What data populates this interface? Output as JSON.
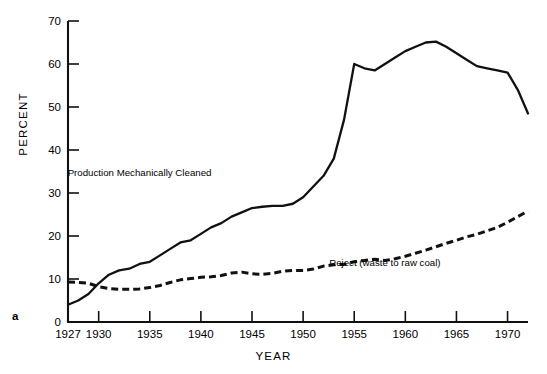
{
  "figure": {
    "panel_letter": "a",
    "background": "#ffffff",
    "line_color": "#111111"
  },
  "chart_data": {
    "type": "line",
    "title": "",
    "xlabel": "YEAR",
    "ylabel": "PERCENT",
    "xlim": [
      1927,
      1972
    ],
    "ylim": [
      0,
      70
    ],
    "xticks": [
      1927,
      1930,
      1935,
      1940,
      1945,
      1950,
      1955,
      1960,
      1965,
      1970
    ],
    "xticklabels": [
      "1927",
      "1930",
      "1935",
      "1940",
      "1945",
      "1950",
      "1955",
      "1960",
      "1965",
      "1970"
    ],
    "yticks": [
      0,
      10,
      20,
      30,
      40,
      50,
      60,
      70
    ],
    "yticklabels": [
      "0",
      "10",
      "20",
      "30",
      "40",
      "50",
      "60",
      "70"
    ],
    "grid": false,
    "legend": "inline-annotations",
    "series": [
      {
        "name": "Production Mechanically Cleaned",
        "style": "solid",
        "annotation": "Production Mechanically Cleaned",
        "annotation_x": 1934.0,
        "annotation_y": 34.0,
        "x": [
          1927,
          1928,
          1929,
          1930,
          1931,
          1932,
          1933,
          1934,
          1935,
          1936,
          1937,
          1938,
          1939,
          1940,
          1941,
          1942,
          1943,
          1944,
          1945,
          1946,
          1947,
          1948,
          1949,
          1950,
          1951,
          1952,
          1953,
          1954,
          1955,
          1956,
          1957,
          1958,
          1959,
          1960,
          1961,
          1962,
          1963,
          1964,
          1965,
          1966,
          1967,
          1968,
          1969,
          1970,
          1971,
          1972
        ],
        "y": [
          4.0,
          5.0,
          6.5,
          9.0,
          11.0,
          12.0,
          12.4,
          13.5,
          14.0,
          15.5,
          17.0,
          18.5,
          19.0,
          20.5,
          22.0,
          23.0,
          24.5,
          25.5,
          26.5,
          26.8,
          27.0,
          27.0,
          27.5,
          29.0,
          31.5,
          34.0,
          38.0,
          47.0,
          60.0,
          59.0,
          58.5,
          60.0,
          61.5,
          63.0,
          64.0,
          65.0,
          65.2,
          64.0,
          62.5,
          61.0,
          59.5,
          59.0,
          58.5,
          58.0,
          54.0,
          48.5
        ]
      },
      {
        "name": "Reject (waste to raw coal)",
        "style": "dashed",
        "annotation": "Reject (waste to raw coal)",
        "annotation_x": 1958.0,
        "annotation_y": 13.0,
        "x": [
          1927,
          1928,
          1929,
          1930,
          1931,
          1932,
          1933,
          1934,
          1935,
          1936,
          1937,
          1938,
          1939,
          1940,
          1941,
          1942,
          1943,
          1944,
          1945,
          1946,
          1947,
          1948,
          1949,
          1950,
          1951,
          1952,
          1953,
          1954,
          1955,
          1956,
          1957,
          1958,
          1959,
          1960,
          1961,
          1962,
          1963,
          1964,
          1965,
          1966,
          1967,
          1968,
          1969,
          1970,
          1971,
          1972
        ],
        "y": [
          9.3,
          9.2,
          9.0,
          8.2,
          7.8,
          7.6,
          7.6,
          7.7,
          8.0,
          8.5,
          9.2,
          9.8,
          10.1,
          10.4,
          10.5,
          10.8,
          11.4,
          11.6,
          11.2,
          11.1,
          11.3,
          11.8,
          12.0,
          12.0,
          12.3,
          13.0,
          13.3,
          13.4,
          14.0,
          14.3,
          14.6,
          14.3,
          14.7,
          15.3,
          16.0,
          16.7,
          17.5,
          18.3,
          19.0,
          19.8,
          20.4,
          21.2,
          22.0,
          23.2,
          24.5,
          25.8
        ]
      }
    ]
  }
}
